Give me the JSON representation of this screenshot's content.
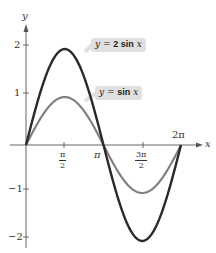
{
  "chart_data": {
    "type": "line",
    "title": "",
    "xlabel": "x",
    "ylabel": "y",
    "xlim": [
      0,
      6.2832
    ],
    "ylim": [
      -2,
      2
    ],
    "grid": false,
    "x_ticks": [
      "π/2",
      "π",
      "3π/2",
      "2π"
    ],
    "y_ticks": [
      "2",
      "1",
      "-1",
      "-2"
    ],
    "series": [
      {
        "name": "y = 2 sin x",
        "color": "#2a2a2a",
        "amplitude": 2,
        "x": [
          "0",
          "π/2",
          "π",
          "3π/2",
          "2π"
        ],
        "values": [
          0,
          2,
          0,
          -2,
          0
        ]
      },
      {
        "name": "y = sin x",
        "color": "#808080",
        "amplitude": 1,
        "x": [
          "0",
          "π/2",
          "π",
          "3π/2",
          "2π"
        ],
        "values": [
          0,
          1,
          0,
          -1,
          0
        ]
      }
    ],
    "annotations": [
      "y = 2 sin x",
      "y = sin x"
    ]
  },
  "labels": {
    "y_axis": "y",
    "x_axis": "x",
    "y2": "2",
    "y1": "1",
    "ym1": "−1",
    "ym2": "−2",
    "pi": "π",
    "two_pi": "2π",
    "half_num": "π",
    "half_den": "2",
    "three_half_num": "3π",
    "three_half_den": "2",
    "tag1_prefix": "y = ",
    "tag1_func": "2 sin",
    "tag1_var": "x",
    "tag2_prefix": "y = ",
    "tag2_func": "sin",
    "tag2_var": "x"
  }
}
